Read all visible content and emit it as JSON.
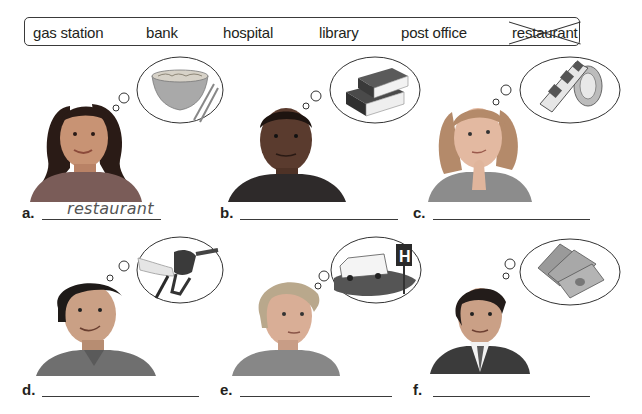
{
  "word_bank": {
    "words": [
      {
        "text": "gas station",
        "crossed_out": false
      },
      {
        "text": "bank",
        "crossed_out": false
      },
      {
        "text": "hospital",
        "crossed_out": false
      },
      {
        "text": "library",
        "crossed_out": false
      },
      {
        "text": "post office",
        "crossed_out": false
      },
      {
        "text": "restaurant",
        "crossed_out": true
      }
    ]
  },
  "items": [
    {
      "letter": "a.",
      "answer": "restaurant",
      "person": "woman-dark-hair",
      "thought": "noodle-bowl-chopsticks-icon"
    },
    {
      "letter": "b.",
      "answer": "",
      "person": "man-bald",
      "thought": "books-icon"
    },
    {
      "letter": "c.",
      "answer": "",
      "person": "woman-blonde-thinking",
      "thought": "stamp-roll-icon"
    },
    {
      "letter": "d.",
      "answer": "",
      "person": "man-smiling",
      "thought": "gas-pump-nozzle-icon"
    },
    {
      "letter": "e.",
      "answer": "",
      "person": "woman-short-hair",
      "thought": "ambulance-hospital-sign-icon"
    },
    {
      "letter": "f.",
      "answer": "",
      "person": "man-suit",
      "thought": "money-bills-icon"
    }
  ],
  "colors": {
    "text": "#231f20",
    "answer_text": "#555555",
    "line": "#3a3a3a"
  }
}
